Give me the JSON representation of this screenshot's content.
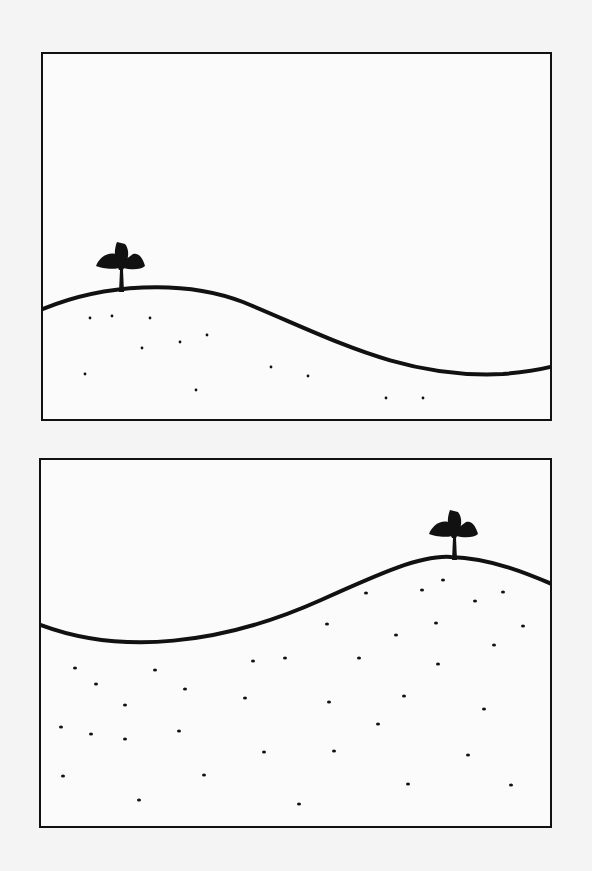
{
  "figure": {
    "colors": {
      "ink": "#111111",
      "paper": "#fbfbfb",
      "background": "#f4f4f4"
    },
    "panels": [
      {
        "id": "top",
        "label": "",
        "hill_path": "M0,255 C60,230 140,225 200,248 C290,285 360,325 460,320 C485,318 500,315 511,312",
        "plant": {
          "x": 78,
          "y": 238,
          "icon": "seedling-icon"
        },
        "seeds": [
          [
            47,
            264
          ],
          [
            69,
            262
          ],
          [
            107,
            264
          ],
          [
            99,
            294
          ],
          [
            137,
            288
          ],
          [
            164,
            281
          ],
          [
            42,
            320
          ],
          [
            153,
            336
          ],
          [
            228,
            313
          ],
          [
            265,
            322
          ],
          [
            343,
            344
          ],
          [
            380,
            344
          ]
        ]
      },
      {
        "id": "bottom",
        "label": "",
        "hill_path": "M0,165 C80,195 180,185 280,140 C340,113 380,95 410,97 C450,98 490,115 513,125",
        "plant": {
          "x": 413,
          "y": 100,
          "icon": "seedling-icon"
        },
        "seeds": [
          [
            325,
            133
          ],
          [
            381,
            130
          ],
          [
            402,
            120
          ],
          [
            434,
            141
          ],
          [
            462,
            132
          ],
          [
            286,
            164
          ],
          [
            395,
            163
          ],
          [
            482,
            166
          ],
          [
            355,
            175
          ],
          [
            453,
            185
          ],
          [
            212,
            201
          ],
          [
            244,
            198
          ],
          [
            318,
            198
          ],
          [
            397,
            204
          ],
          [
            34,
            208
          ],
          [
            114,
            210
          ],
          [
            55,
            224
          ],
          [
            144,
            229
          ],
          [
            204,
            238
          ],
          [
            288,
            242
          ],
          [
            363,
            236
          ],
          [
            443,
            249
          ],
          [
            84,
            245
          ],
          [
            20,
            267
          ],
          [
            50,
            274
          ],
          [
            138,
            271
          ],
          [
            84,
            279
          ],
          [
            337,
            264
          ],
          [
            223,
            292
          ],
          [
            293,
            291
          ],
          [
            427,
            295
          ],
          [
            22,
            316
          ],
          [
            163,
            315
          ],
          [
            367,
            324
          ],
          [
            470,
            325
          ],
          [
            98,
            340
          ],
          [
            258,
            344
          ]
        ]
      }
    ]
  }
}
